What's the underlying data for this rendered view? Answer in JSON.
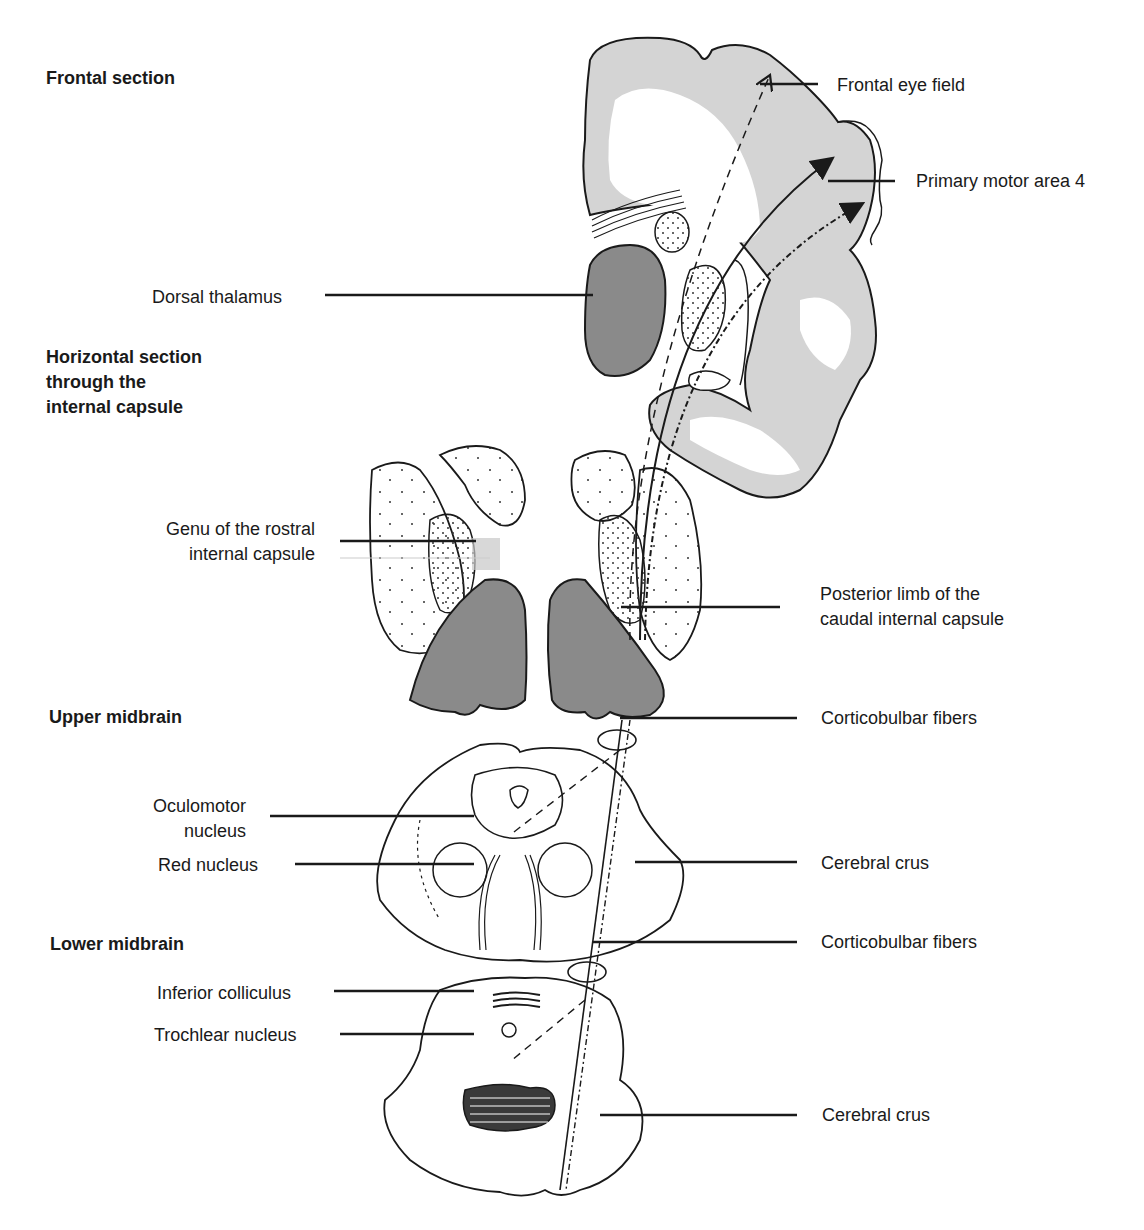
{
  "figure": {
    "section_titles": [
      {
        "id": "frontal",
        "text": "Frontal section"
      },
      {
        "id": "horizontal",
        "lines": [
          "Horizontal section",
          "through the",
          "internal capsule"
        ]
      },
      {
        "id": "upper-midbrain",
        "text": "Upper midbrain"
      },
      {
        "id": "lower-midbrain",
        "text": "Lower midbrain"
      }
    ],
    "left_labels": {
      "dorsal_thalamus": "Dorsal thalamus",
      "genu_line1": "Genu of the rostral",
      "genu_line2": "internal capsule",
      "oculomotor_line1": "Oculomotor",
      "oculomotor_line2": "nucleus",
      "red_nucleus": "Red nucleus",
      "inferior_colliculus": "Inferior colliculus",
      "trochlear_nucleus": "Trochlear nucleus"
    },
    "right_labels": {
      "frontal_eye_field": "Frontal eye field",
      "primary_motor_area": "Primary motor area 4",
      "posterior_limb_line1": "Posterior limb of the",
      "posterior_limb_line2": "caudal internal capsule",
      "corticobulbar_upper": "Corticobulbar fibers",
      "cerebral_crus_upper": "Cerebral crus",
      "corticobulbar_lower": "Corticobulbar fibers",
      "cerebral_crus_lower": "Cerebral crus"
    },
    "colors": {
      "ink": "#1a1a1a",
      "cortex_gray": "#d4d4d4",
      "dark_gray": "#8a8a8a",
      "background": "#ffffff"
    }
  }
}
